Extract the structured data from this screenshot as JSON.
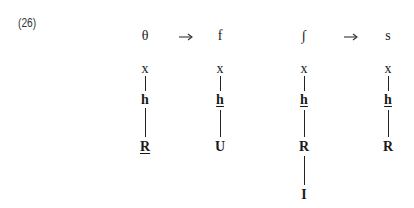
{
  "example_number": "(26)",
  "arrows": [
    "→",
    "→"
  ],
  "trees": [
    {
      "top": "θ",
      "nodes": [
        {
          "text": "x",
          "bold": false,
          "underline": false
        },
        {
          "text": "h",
          "bold": true,
          "underline": false
        },
        {
          "text": "R",
          "bold": true,
          "underline": true
        }
      ]
    },
    {
      "top": "f",
      "nodes": [
        {
          "text": "x",
          "bold": false,
          "underline": false
        },
        {
          "text": "h",
          "bold": true,
          "underline": true
        },
        {
          "text": "U",
          "bold": true,
          "underline": false
        }
      ]
    },
    {
      "top": "∫",
      "nodes": [
        {
          "text": "x",
          "bold": false,
          "underline": false
        },
        {
          "text": "h",
          "bold": true,
          "underline": true
        },
        {
          "text": "R",
          "bold": true,
          "underline": false
        },
        {
          "text": "I",
          "bold": true,
          "underline": false
        }
      ]
    },
    {
      "top": "s",
      "nodes": [
        {
          "text": "x",
          "bold": false,
          "underline": false
        },
        {
          "text": "h",
          "bold": true,
          "underline": true
        },
        {
          "text": "R",
          "bold": true,
          "underline": false
        }
      ]
    }
  ]
}
